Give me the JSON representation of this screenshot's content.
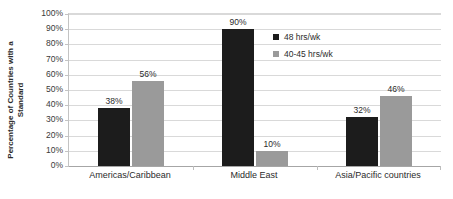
{
  "chart_data": {
    "type": "bar",
    "title": "",
    "subtitle": "",
    "xlabel": "",
    "ylabel": "Percentage of Countries with a Standard",
    "ylabel_lines": [
      "Percentage of Countries with a",
      "Standard"
    ],
    "categories": [
      "Americas/Caribbean",
      "Middle East",
      "Asia/Pacific countries"
    ],
    "series": [
      {
        "name": "48 hrs/wk",
        "color": "#1c1c1c",
        "values": [
          38,
          90,
          32
        ],
        "labels": [
          "38%",
          "90%",
          "32%"
        ]
      },
      {
        "name": "40-45 hrs/wk",
        "color": "#9a9a9a",
        "values": [
          56,
          10,
          46
        ],
        "labels": [
          "56%",
          "10%",
          "46%"
        ]
      }
    ],
    "ylim": [
      0,
      100
    ],
    "ytick_step": 10,
    "ytick_labels": [
      "100%",
      "90%",
      "80%",
      "70%",
      "60%",
      "50%",
      "40%",
      "30%",
      "20%",
      "10%",
      "0%"
    ],
    "ytick_values": [
      100,
      90,
      80,
      70,
      60,
      50,
      40,
      30,
      20,
      10,
      0
    ],
    "grid": true,
    "legend_position": "inside-top-right",
    "value_labels_shown": true
  },
  "colors": {
    "series_dark": "#1c1c1c",
    "series_light": "#9a9a9a",
    "gridline": "#d9d9d9",
    "axis": "#a6a6a6",
    "text": "#2b2b2b",
    "background": "#ffffff"
  }
}
